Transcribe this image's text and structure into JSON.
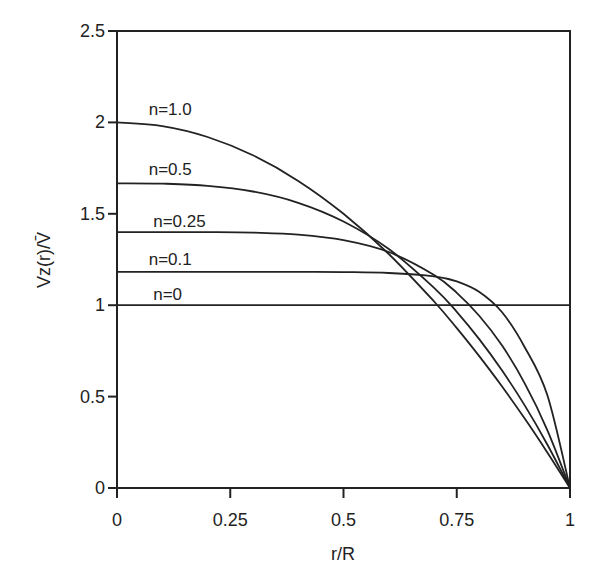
{
  "chart_data": {
    "type": "line",
    "title": "",
    "xlabel": "r/R",
    "ylabel": "Vz(r)/V̄",
    "xlim": [
      0,
      1
    ],
    "ylim": [
      0,
      2.5
    ],
    "grid": false,
    "legend": "inline curve labels",
    "x_ticks": [
      {
        "value": 0,
        "label": "0"
      },
      {
        "value": 0.25,
        "label": "0.25"
      },
      {
        "value": 0.5,
        "label": "0.5"
      },
      {
        "value": 0.75,
        "label": "0.75"
      },
      {
        "value": 1,
        "label": "1"
      }
    ],
    "y_ticks": [
      {
        "value": 0,
        "label": "0"
      },
      {
        "value": 0.5,
        "label": "0.5"
      },
      {
        "value": 1,
        "label": "1"
      },
      {
        "value": 1.5,
        "label": "1.5"
      },
      {
        "value": 2,
        "label": "2"
      },
      {
        "value": 2.5,
        "label": "2.5"
      }
    ],
    "x": [
      0,
      0.1,
      0.2,
      0.3,
      0.4,
      0.5,
      0.6,
      0.7,
      0.75,
      0.8,
      0.85,
      0.9,
      0.95,
      1.0
    ],
    "series": [
      {
        "name": "n=1.0",
        "label_pos": [
          0.07,
          2.04
        ],
        "values": [
          2.0,
          1.98,
          1.92,
          1.82,
          1.68,
          1.5,
          1.28,
          1.02,
          0.875,
          0.72,
          0.555,
          0.38,
          0.195,
          0
        ]
      },
      {
        "name": "n=0.5",
        "label_pos": [
          0.07,
          1.71
        ],
        "values": [
          1.667,
          1.665,
          1.653,
          1.622,
          1.56,
          1.458,
          1.307,
          1.095,
          0.964,
          0.813,
          0.643,
          0.452,
          0.238,
          0
        ]
      },
      {
        "name": "n=0.25",
        "label_pos": [
          0.08,
          1.43
        ],
        "values": [
          1.4,
          1.4,
          1.4,
          1.397,
          1.386,
          1.356,
          1.291,
          1.165,
          1.068,
          0.941,
          0.779,
          0.573,
          0.317,
          0
        ]
      },
      {
        "name": "n=0.1",
        "label_pos": [
          0.07,
          1.22
        ],
        "values": [
          1.182,
          1.182,
          1.182,
          1.182,
          1.182,
          1.181,
          1.176,
          1.158,
          1.13,
          1.072,
          0.961,
          0.77,
          0.508,
          0
        ]
      },
      {
        "name": "n=0",
        "label_pos": [
          0.08,
          1.03
        ],
        "values": [
          1,
          1,
          1,
          1,
          1,
          1,
          1,
          1,
          1,
          1,
          1,
          1,
          1,
          1
        ]
      }
    ]
  }
}
